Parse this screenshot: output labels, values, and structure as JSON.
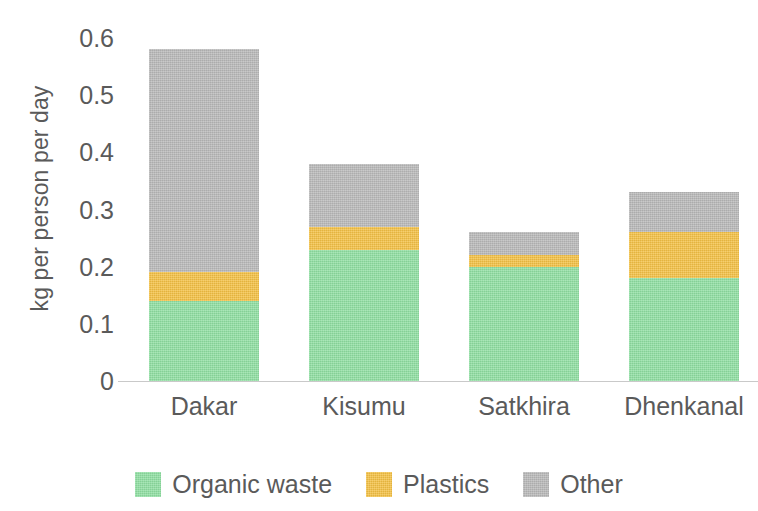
{
  "chart_data": {
    "type": "bar",
    "stacked": true,
    "title": "",
    "xlabel": "",
    "ylabel": "kg per person per day",
    "categories": [
      "Dakar",
      "Kisumu",
      "Satkhira",
      "Dhenkanal"
    ],
    "ylim": [
      0,
      0.6
    ],
    "yticks": [
      0,
      0.1,
      0.2,
      0.3,
      0.4,
      0.5,
      0.6
    ],
    "ytick_labels": [
      "0",
      "0.1",
      "0.2",
      "0.3",
      "0.4",
      "0.5",
      "0.6"
    ],
    "grid": false,
    "legend_position": "bottom",
    "series": [
      {
        "name": "Organic waste",
        "color": "#90e0a2",
        "values": [
          0.14,
          0.23,
          0.2,
          0.18
        ]
      },
      {
        "name": "Plastics",
        "color": "#f5c144",
        "values": [
          0.05,
          0.04,
          0.02,
          0.08
        ]
      },
      {
        "name": "Other",
        "color": "#b9b9b9",
        "values": [
          0.39,
          0.11,
          0.04,
          0.07
        ]
      }
    ],
    "totals": [
      0.58,
      0.38,
      0.26,
      0.33
    ]
  },
  "axis": {
    "y_title": "kg per person per day"
  },
  "legend": {
    "items": [
      {
        "label": "Organic waste",
        "swatch": "organic-waste-swatch"
      },
      {
        "label": "Plastics",
        "swatch": "plastics-swatch"
      },
      {
        "label": "Other",
        "swatch": "other-swatch"
      }
    ]
  }
}
